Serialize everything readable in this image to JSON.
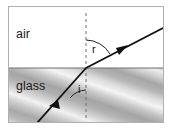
{
  "figure": {
    "frame": {
      "border_color": "#b0b0b0",
      "background_color": "#ffffff"
    },
    "media": [
      {
        "id": "air",
        "label": "air",
        "region": "upper",
        "fill_color": "#ffffff"
      },
      {
        "id": "glass",
        "label": "glass",
        "region": "lower",
        "fill_color": "#c8c8c8",
        "pattern": "diagonal-gradient-stripes"
      }
    ],
    "boundary": {
      "name": "interface-line",
      "color": "#6b6b6b",
      "orientation": "horizontal"
    },
    "normal": {
      "name": "normal-line",
      "style": "dashed",
      "color": "#6b6b6b",
      "orientation": "vertical"
    },
    "rays": [
      {
        "id": "incident-ray",
        "medium": "glass",
        "direction": "up-right",
        "color": "#111111",
        "arrowhead": true
      },
      {
        "id": "refracted-ray",
        "medium": "air",
        "direction": "up-right",
        "color": "#111111",
        "arrowhead": true
      }
    ],
    "angles": [
      {
        "id": "angle-i",
        "label": "i",
        "measured_from": "normal",
        "ray": "incident-ray",
        "side": "below-boundary",
        "approx_degrees": 35
      },
      {
        "id": "angle-r",
        "label": "r",
        "measured_from": "normal",
        "ray": "refracted-ray",
        "side": "above-boundary",
        "approx_degrees": 58
      }
    ]
  }
}
